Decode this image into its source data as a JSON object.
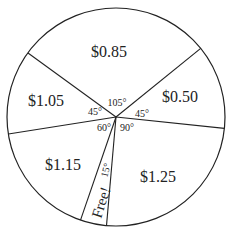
{
  "diagram": {
    "type": "pie-spinner",
    "center": [
      116,
      117
    ],
    "radius": 109,
    "start_angle": -39,
    "sectors": [
      {
        "label": "$0.50",
        "angle": 45,
        "angle_label": "45°"
      },
      {
        "label": "$1.25",
        "angle": 90,
        "angle_label": "90°"
      },
      {
        "label": "Free!",
        "angle": 15,
        "angle_label": "15°"
      },
      {
        "label": "$1.15",
        "angle": 60,
        "angle_label": "60°"
      },
      {
        "label": "$1.05",
        "angle": 45,
        "angle_label": "45°"
      },
      {
        "label": "$0.85",
        "angle": 105,
        "angle_label": "105°"
      }
    ]
  },
  "labels": {
    "s050": "$0.50",
    "s125": "$1.25",
    "free": "Free!",
    "s115": "$1.15",
    "s105": "$1.05",
    "s085": "$0.85",
    "a45_right": "45°",
    "a90": "90°",
    "a15": "15°",
    "a60": "60°",
    "a45_left": "45°",
    "a105": "105°"
  }
}
